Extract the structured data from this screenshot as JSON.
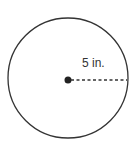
{
  "diagram": {
    "shape": "circle",
    "radius_label": "5 in.",
    "colors": {
      "stroke": "#333333",
      "background": "#ffffff"
    }
  }
}
